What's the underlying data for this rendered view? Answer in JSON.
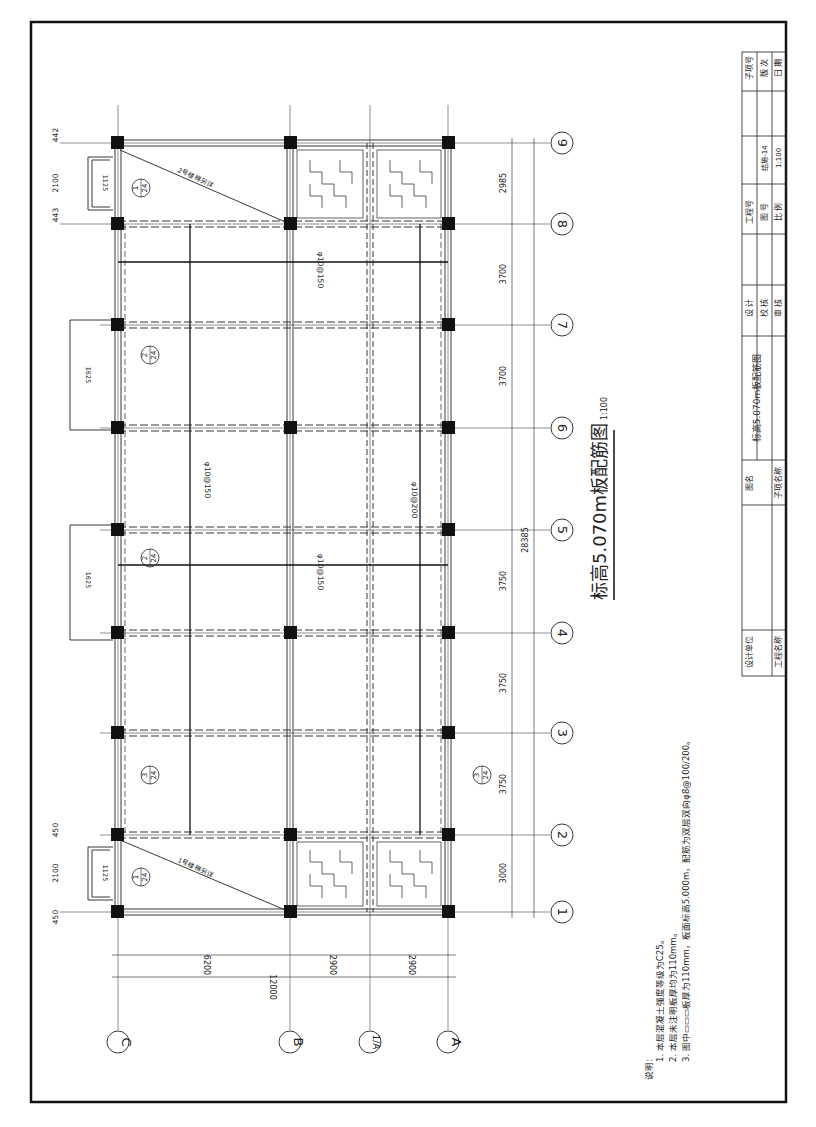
{
  "drawing": {
    "title": "标高5.070m板配筋图",
    "scale": "1:100",
    "axes_letters": [
      {
        "label": "C",
        "x": 118
      },
      {
        "label": "B",
        "x": 290
      },
      {
        "label": "1/A",
        "x": 370
      },
      {
        "label": "A",
        "x": 448
      }
    ],
    "axes_numbers": [
      {
        "label": "1",
        "y": 912
      },
      {
        "label": "2",
        "y": 835
      },
      {
        "label": "3",
        "y": 733
      },
      {
        "label": "4",
        "y": 633
      },
      {
        "label": "5",
        "y": 530
      },
      {
        "label": "6",
        "y": 428
      },
      {
        "label": "7",
        "y": 325
      },
      {
        "label": "8",
        "y": 224
      },
      {
        "label": "9",
        "y": 143
      }
    ],
    "dims_letters": {
      "segments": [
        "6200",
        "2900",
        "2900"
      ],
      "total": "12000"
    },
    "dims_numbers": {
      "segments": [
        "3000",
        "3750",
        "3750",
        "3750",
        "3700",
        "3700",
        "2985"
      ],
      "total": "28385"
    },
    "rebar_labels": {
      "top_left": "φ10@150",
      "top_right": "φ10@150",
      "long_1": "φ10@150",
      "long_2": "φ10@200"
    },
    "stairs": [
      {
        "name": "1号楼梯另详",
        "marker_top": "1",
        "marker_bottom": "24",
        "dims": [
          "450",
          "2100",
          "450"
        ],
        "width": "1125"
      },
      {
        "name": "2号楼梯另详",
        "marker_top": "1",
        "marker_bottom": "24",
        "dims": [
          "442",
          "2100",
          "443"
        ],
        "width": "1125"
      }
    ],
    "details": [
      {
        "marker_top": "2",
        "marker_bottom": "24",
        "width": "1625"
      },
      {
        "marker_top": "2",
        "marker_bottom": "24",
        "width": "1625"
      },
      {
        "marker_top": "3",
        "marker_bottom": "24"
      },
      {
        "marker_top": "3",
        "marker_bottom": "24"
      }
    ],
    "column_offsets": [
      "675",
      "650",
      "60",
      "65"
    ]
  },
  "notes": {
    "heading": "说明:",
    "items": [
      "1. 本层混凝土强度等级为C25。",
      "2. 本层未注明板厚均为110mm。",
      "3. 图中▭▭▭板厚为110mm，板面标高5.000m，配筋为双层双向φ8@100/200。"
    ]
  },
  "title_block": {
    "design_unit_label": "设计单位",
    "project_name_label": "工程名称",
    "drawing_name_label": "图名",
    "drawing_name_value": "标高5.070m板配筋图",
    "sub_item_name_label": "子项名称",
    "design_label": "设 计",
    "check_label": "校 核",
    "review_label": "审 核",
    "project_no_label": "工程号",
    "drawing_no_label": "图 号",
    "drawing_no_value": "结施-14",
    "scale_label": "比 例",
    "scale_value": "1:100",
    "sub_item_no_label": "子项号",
    "version_label": "版 次",
    "date_label": "日 期"
  }
}
